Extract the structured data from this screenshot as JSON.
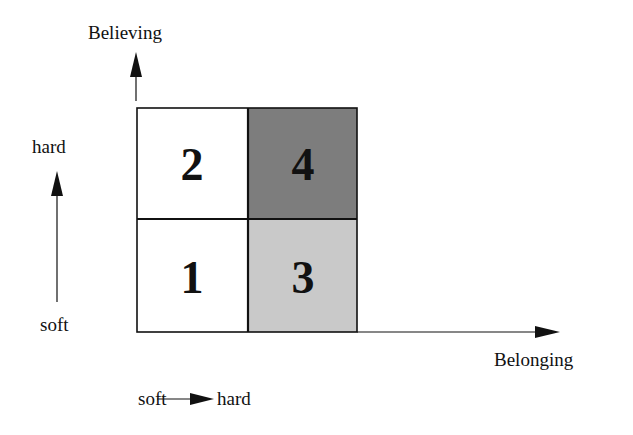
{
  "diagram": {
    "type": "2x2 quadrant matrix",
    "y_axis": {
      "label": "Believing"
    },
    "x_axis": {
      "label": "Belonging"
    },
    "legend_vertical": {
      "top": "hard",
      "bottom": "soft"
    },
    "legend_horizontal": {
      "left": "soft",
      "right": "hard"
    },
    "quadrants": [
      {
        "position": "bottom-left",
        "number": "1",
        "fill": "#ffffff"
      },
      {
        "position": "top-left",
        "number": "2",
        "fill": "#ffffff"
      },
      {
        "position": "bottom-right",
        "number": "3",
        "fill": "#c9c9c9"
      },
      {
        "position": "top-right",
        "number": "4",
        "fill": "#7d7d7d"
      }
    ]
  }
}
